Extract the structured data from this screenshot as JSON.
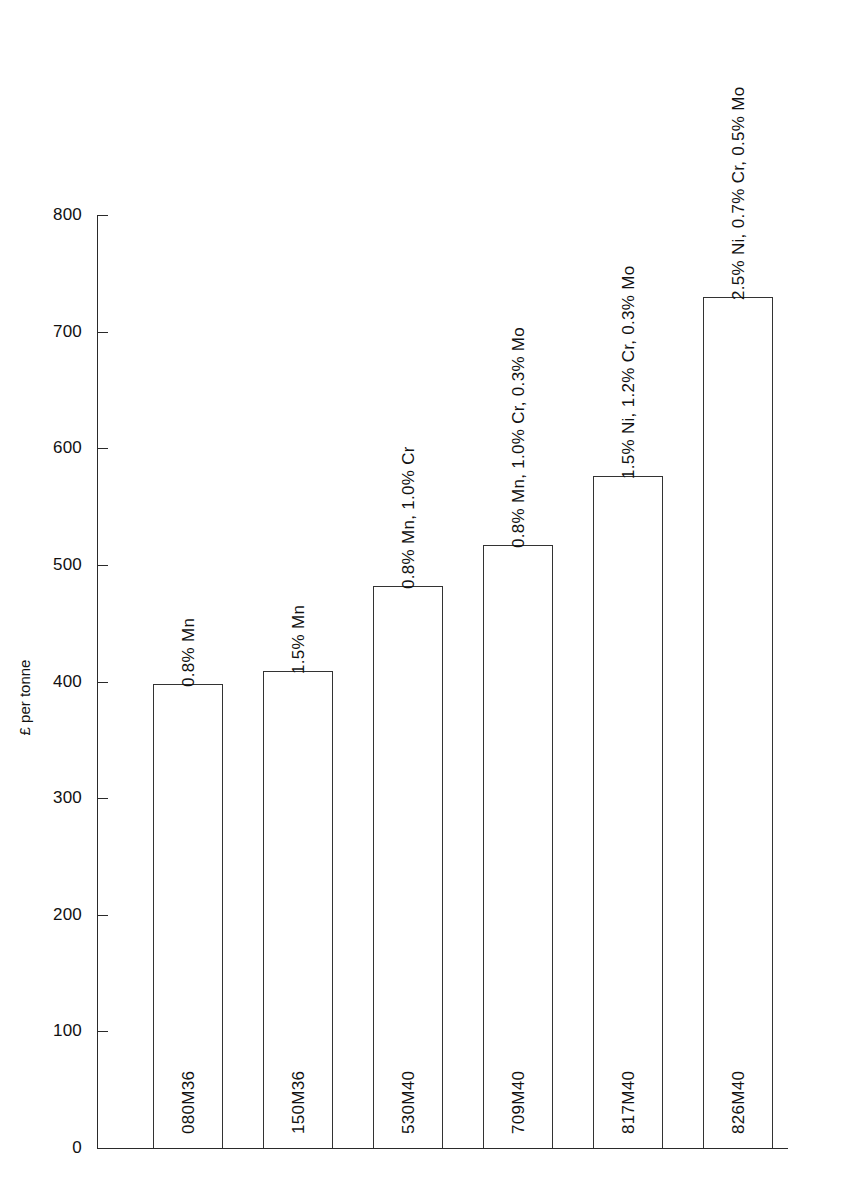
{
  "chart_data": {
    "type": "bar",
    "title": "",
    "xlabel": "",
    "ylabel": "£ per tonne",
    "ylim": [
      0,
      800
    ],
    "y_ticks": [
      0,
      100,
      200,
      300,
      400,
      500,
      600,
      700,
      800
    ],
    "grid": false,
    "legend": "none",
    "categories": [
      "080M36",
      "150M36",
      "530M40",
      "709M40",
      "817M40",
      "826M40"
    ],
    "values": [
      398,
      409,
      482,
      517,
      576,
      730
    ],
    "annotations": [
      "0.8%  Mn",
      "1.5% Mn",
      "0.8% Mn, 1.0% Cr",
      "0.8% Mn, 1.0% Cr, 0.3% Mo",
      "1.5% Ni, 1.2% Cr, 0.3% Mo",
      "2.5% Ni, 0.7% Cr, 0.5% Mo"
    ],
    "bars": [
      {
        "code": "080M36",
        "value": 398,
        "composition": "0.8%  Mn"
      },
      {
        "code": "150M36",
        "value": 409,
        "composition": "1.5% Mn"
      },
      {
        "code": "530M40",
        "value": 482,
        "composition": "0.8% Mn, 1.0% Cr"
      },
      {
        "code": "709M40",
        "value": 517,
        "composition": "0.8% Mn, 1.0% Cr, 0.3% Mo"
      },
      {
        "code": "817M40",
        "value": 576,
        "composition": "1.5% Ni, 1.2% Cr, 0.3% Mo"
      },
      {
        "code": "826M40",
        "value": 730,
        "composition": "2.5% Ni, 0.7% Cr, 0.5% Mo"
      }
    ]
  },
  "axis": {
    "ticks": [
      {
        "label": "800"
      },
      {
        "label": "700"
      },
      {
        "label": "600"
      },
      {
        "label": "500"
      },
      {
        "label": "400"
      },
      {
        "label": "300"
      },
      {
        "label": "200"
      },
      {
        "label": "100"
      },
      {
        "label": "0"
      }
    ],
    "title": "£ per tonne"
  },
  "style": {
    "bar_stroke": "#333333",
    "bar_fill": "#ffffff",
    "axis_color": "#2a2a2a",
    "text_color": "#111111",
    "background": "#ffffff"
  }
}
